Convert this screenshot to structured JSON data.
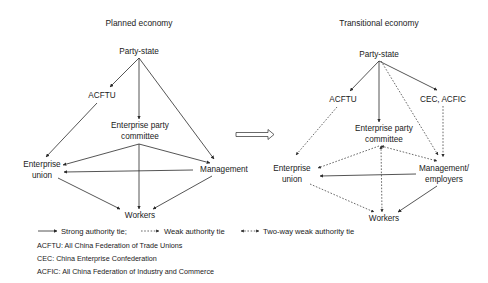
{
  "arrow_between_panels": "hollow-right-arrow",
  "panels": {
    "left": {
      "title": "Planned economy",
      "nodes": {
        "party_state": "Party-state",
        "acftu": "ACFTU",
        "party_committee_line1": "Enterprise party",
        "party_committee_line2": "committee",
        "union_line1": "Enterprise",
        "union_line2": "union",
        "management": "Management",
        "workers": "Workers"
      },
      "edges": [
        {
          "from": "Party-state",
          "to": "ACFTU",
          "type": "strong"
        },
        {
          "from": "Party-state",
          "to": "Enterprise party committee",
          "type": "strong"
        },
        {
          "from": "Party-state",
          "to": "Management",
          "type": "strong"
        },
        {
          "from": "ACFTU",
          "to": "Enterprise union",
          "type": "strong"
        },
        {
          "from": "Enterprise party committee",
          "to": "Enterprise union",
          "type": "strong"
        },
        {
          "from": "Enterprise party committee",
          "to": "Management",
          "type": "strong"
        },
        {
          "from": "Enterprise party committee",
          "to": "Workers",
          "type": "strong"
        },
        {
          "from": "Management",
          "to": "Enterprise union",
          "type": "strong"
        },
        {
          "from": "Enterprise union",
          "to": "Workers",
          "type": "strong"
        },
        {
          "from": "Management",
          "to": "Workers",
          "type": "strong"
        }
      ]
    },
    "right": {
      "title": "Transitional economy",
      "nodes": {
        "party_state": "Party-state",
        "acftu": "ACFTU",
        "cec_acfic": "CEC, ACFIC",
        "party_committee_line1": "Enterprise party",
        "party_committee_line2": "committee",
        "union_line1": "Enterprise",
        "union_line2": "union",
        "management_line1": "Management/",
        "management_line2": "employers",
        "workers": "Workers"
      },
      "edges": [
        {
          "from": "Party-state",
          "to": "ACFTU",
          "type": "strong"
        },
        {
          "from": "Party-state",
          "to": "Enterprise party committee",
          "type": "strong"
        },
        {
          "from": "Party-state",
          "to": "CEC, ACFIC",
          "type": "strong"
        },
        {
          "from": "Party-state",
          "to": "Management/employers",
          "type": "weak"
        },
        {
          "from": "ACFTU",
          "to": "Enterprise union",
          "type": "weak"
        },
        {
          "from": "CEC, ACFIC",
          "to": "Management/employers",
          "type": "weak"
        },
        {
          "from": "Enterprise party committee",
          "to": "Enterprise union",
          "type": "weak"
        },
        {
          "from": "Enterprise party committee",
          "to": "Management/employers",
          "type": "two-way weak"
        },
        {
          "from": "Enterprise party committee",
          "to": "Workers",
          "type": "two-way weak"
        },
        {
          "from": "Management/employers",
          "to": "Enterprise union",
          "type": "strong"
        },
        {
          "from": "Enterprise union",
          "to": "Workers",
          "type": "weak"
        },
        {
          "from": "Management/employers",
          "to": "Workers",
          "type": "strong"
        }
      ]
    }
  },
  "legend": {
    "strong": "Strong authority tie;",
    "weak": "Weak authority tie",
    "two_way": "Two-way weak authority tie"
  },
  "definitions": [
    "ACFTU: All China Federation of Trade Unions",
    "CEC: China Enterprise Confederation",
    "ACFIC: All China Federation of Industry and Commerce"
  ]
}
